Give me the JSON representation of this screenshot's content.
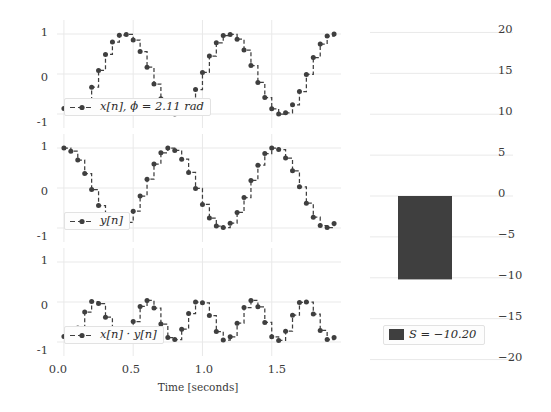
{
  "figure": {
    "background_color": "#ffffff",
    "line_color": "#3f3f3f",
    "grid_color": "#e9e9e9"
  },
  "left_panel": {
    "xlabel": "Time [seconds]",
    "xticks": [
      "0.0",
      "0.5",
      "1.0",
      "1.5"
    ],
    "xtick_values": [
      0.0,
      0.5,
      1.0,
      1.5
    ],
    "yticks": [
      "1",
      "0",
      "-1"
    ],
    "ytick_values": [
      1,
      0,
      -1
    ],
    "subplots": [
      {
        "legend": "x[n], ϕ = 2.11 rad",
        "name": "x-signal"
      },
      {
        "legend": "y[n]",
        "name": "y-signal"
      },
      {
        "legend": "x[n] · y[n]",
        "name": "product-signal"
      }
    ]
  },
  "right_panel": {
    "yticks": [
      "20",
      "15",
      "10",
      "5",
      "0",
      "−5",
      "−10",
      "−15",
      "−20"
    ],
    "ytick_values": [
      20,
      15,
      10,
      5,
      0,
      -5,
      -10,
      -15,
      -20
    ],
    "legend": "S = −10.20",
    "bar_color": "#3f3f3f"
  },
  "chart_data": [
    {
      "type": "line",
      "name": "x[n]",
      "title": "",
      "xlabel": "Time [seconds]",
      "ylabel": "",
      "xlim": [
        -0.05,
        2.0
      ],
      "ylim": [
        -1.35,
        1.35
      ],
      "grid": true,
      "legend": "x[n], ϕ = 2.11 rad",
      "legend_position": "lower left",
      "drawstyle": "steps-post",
      "marker": "o",
      "linestyle": "dashed",
      "phase_rad": 2.11,
      "frequency_hz": 1.3,
      "sample_count": 40,
      "sample_period": 0.05,
      "x": [
        0.0,
        0.05,
        0.1,
        0.15,
        0.2,
        0.25,
        0.3,
        0.35,
        0.4,
        0.45,
        0.5,
        0.55,
        0.6,
        0.65,
        0.7,
        0.75,
        0.8,
        0.85,
        0.9,
        0.95,
        1.0,
        1.05,
        1.1,
        1.15,
        1.2,
        1.25,
        1.3,
        1.35,
        1.4,
        1.45,
        1.5,
        1.55,
        1.6,
        1.65,
        1.7,
        1.75,
        1.8,
        1.85,
        1.9,
        1.95
      ],
      "y": [
        -0.86,
        -0.99,
        -0.93,
        -0.7,
        -0.33,
        0.09,
        0.49,
        0.8,
        0.97,
        0.99,
        0.85,
        0.56,
        0.17,
        -0.25,
        -0.62,
        -0.89,
        -1.0,
        -0.95,
        -0.74,
        -0.39,
        0.04,
        0.45,
        0.78,
        0.96,
        0.99,
        0.87,
        0.6,
        0.21,
        -0.21,
        -0.59,
        -0.87,
        -1.0,
        -0.97,
        -0.77,
        -0.44,
        -0.01,
        0.41,
        0.75,
        0.95,
        1.0
      ]
    },
    {
      "type": "line",
      "name": "y[n]",
      "title": "",
      "xlabel": "",
      "ylabel": "",
      "xlim": [
        -0.05,
        2.0
      ],
      "ylim": [
        -1.35,
        1.35
      ],
      "grid": true,
      "legend": "y[n]",
      "legend_position": "lower left",
      "drawstyle": "steps-post",
      "marker": "o",
      "linestyle": "dashed",
      "phase_rad": 0.0,
      "frequency_hz": 1.3,
      "sample_count": 40,
      "sample_period": 0.05,
      "x": [
        0.0,
        0.05,
        0.1,
        0.15,
        0.2,
        0.25,
        0.3,
        0.35,
        0.4,
        0.45,
        0.5,
        0.55,
        0.6,
        0.65,
        0.7,
        0.75,
        0.8,
        0.85,
        0.9,
        0.95,
        1.0,
        1.05,
        1.1,
        1.15,
        1.2,
        1.25,
        1.3,
        1.35,
        1.4,
        1.45,
        1.5,
        1.55,
        1.6,
        1.65,
        1.7,
        1.75,
        1.8,
        1.85,
        1.9,
        1.95
      ],
      "y": [
        1.0,
        0.92,
        0.7,
        0.36,
        -0.04,
        -0.44,
        -0.77,
        -0.96,
        -0.99,
        -0.86,
        -0.58,
        -0.2,
        0.22,
        0.6,
        0.88,
        1.0,
        0.94,
        0.72,
        0.39,
        -0.01,
        -0.41,
        -0.75,
        -0.95,
        -0.99,
        -0.88,
        -0.61,
        -0.24,
        0.19,
        0.57,
        0.86,
        1.0,
        0.96,
        0.75,
        0.43,
        0.03,
        -0.38,
        -0.73,
        -0.94,
        -0.99,
        -0.89
      ]
    },
    {
      "type": "line",
      "name": "x[n]*y[n]",
      "title": "",
      "xlabel": "",
      "ylabel": "",
      "xlim": [
        -0.05,
        2.0
      ],
      "ylim": [
        -1.35,
        1.35
      ],
      "grid": true,
      "legend": "x[n] · y[n]",
      "legend_position": "lower left",
      "drawstyle": "steps-post",
      "marker": "o",
      "linestyle": "dashed",
      "sample_count": 40,
      "sample_period": 0.05,
      "x": [
        0.0,
        0.05,
        0.1,
        0.15,
        0.2,
        0.25,
        0.3,
        0.35,
        0.4,
        0.45,
        0.5,
        0.55,
        0.6,
        0.65,
        0.7,
        0.75,
        0.8,
        0.85,
        0.9,
        0.95,
        1.0,
        1.05,
        1.1,
        1.15,
        1.2,
        1.25,
        1.3,
        1.35,
        1.4,
        1.45,
        1.5,
        1.55,
        1.6,
        1.65,
        1.7,
        1.75,
        1.8,
        1.85,
        1.9,
        1.95
      ],
      "y": [
        -0.86,
        -0.91,
        -0.65,
        -0.25,
        0.01,
        -0.04,
        -0.38,
        -0.77,
        -0.96,
        -0.85,
        -0.49,
        -0.11,
        0.04,
        -0.15,
        -0.55,
        -0.89,
        -0.94,
        -0.68,
        -0.29,
        0.0,
        -0.02,
        -0.34,
        -0.74,
        -0.95,
        -0.87,
        -0.53,
        -0.14,
        0.04,
        -0.12,
        -0.51,
        -0.87,
        -0.96,
        -0.73,
        -0.33,
        -0.01,
        0.0,
        -0.3,
        -0.71,
        -0.94,
        -0.89
      ]
    },
    {
      "type": "bar",
      "name": "sum-bar",
      "title": "",
      "xlabel": "",
      "ylabel": "",
      "categories": [
        "S"
      ],
      "values": [
        -10.2
      ],
      "ylim": [
        -22.5,
        22.5
      ],
      "yticks": [
        20,
        15,
        10,
        5,
        0,
        -5,
        -10,
        -15,
        -20
      ],
      "grid": true,
      "legend": "S = −10.20",
      "legend_position": "lower left",
      "bar_color": "#3f3f3f"
    }
  ]
}
